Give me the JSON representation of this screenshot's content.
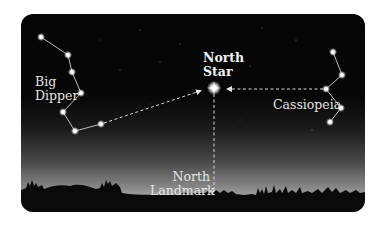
{
  "diagram": {
    "labels": {
      "big_dipper_line1": "Big",
      "big_dipper_line2": "Dipper",
      "north_star_line1": "North",
      "north_star_line2": "Star",
      "cassiopeia": "Cassiopeia",
      "north_landmark_line1": "North",
      "north_landmark_line2": "Landmark"
    },
    "constellations": [
      {
        "name": "Big Dipper",
        "stars": [
          [
            41,
            37
          ],
          [
            68,
            55
          ],
          [
            72,
            72
          ],
          [
            81,
            93
          ],
          [
            63,
            112
          ],
          [
            75,
            131
          ],
          [
            101,
            124
          ]
        ]
      },
      {
        "name": "Cassiopeia",
        "stars": [
          [
            333,
            52
          ],
          [
            342,
            75
          ],
          [
            326,
            89
          ],
          [
            341,
            108
          ],
          [
            330,
            122
          ]
        ]
      }
    ],
    "north_star": [
      214,
      88
    ],
    "pointer_lines": [
      {
        "from": "Big Dipper",
        "to": "North Star",
        "style": "dashed-arrow"
      },
      {
        "from": "Cassiopeia",
        "to": "North Star",
        "style": "dashed-arrow"
      },
      {
        "from": "North Star",
        "to": "North Landmark",
        "style": "dashed"
      }
    ],
    "colors": {
      "sky_top": "#050505",
      "horizon_glow": "#b5b5b5",
      "star": "#ffffff",
      "line": "#d8d8d8",
      "silhouette": "#0a0a0a"
    }
  }
}
